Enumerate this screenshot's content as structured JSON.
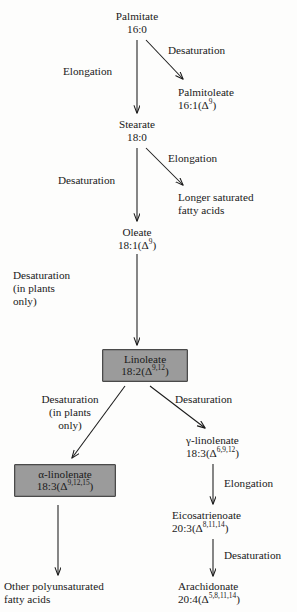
{
  "diagram": {
    "background_color": "#fdfdfc",
    "text_color": "#1a1a1a",
    "highlight_box_fill": "#9b9b9b",
    "highlight_box_border": "#4a4a4a",
    "arrow_color": "#1a1a1a"
  },
  "nodes": {
    "palmitate": {
      "name": "Palmitate",
      "formula": "16:0",
      "formula_html": "16:0",
      "boxed": false
    },
    "palmitoleate": {
      "name": "Palmitoleate",
      "formula": "16:1(Δ9)",
      "formula_html": "16:1(Δ<sup>9</sup>)",
      "boxed": false
    },
    "stearate": {
      "name": "Stearate",
      "formula": "18:0",
      "formula_html": "18:0",
      "boxed": false
    },
    "longer_saturated": {
      "name": "Longer saturated",
      "formula": "fatty acids",
      "formula_html": "fatty acids",
      "boxed": false
    },
    "oleate": {
      "name": "Oleate",
      "formula": "18:1(Δ9)",
      "formula_html": "18:1(Δ<sup>9</sup>)",
      "boxed": false
    },
    "linoleate": {
      "name": "Linoleate",
      "formula": "18:2(Δ9,12)",
      "formula_html": "18:2(Δ<sup>9,12</sup>)",
      "boxed": true
    },
    "alpha_linolenate": {
      "name": "α-linolenate",
      "formula": "18:3(Δ9,12,15)",
      "formula_html": "18:3(Δ<sup>9,12,15</sup>)",
      "boxed": true
    },
    "gamma_linolenate": {
      "name": "γ-linolenate",
      "formula": "18:3(Δ6,9,12)",
      "formula_html": "18:3(Δ<sup>6,9,12</sup>)",
      "boxed": false
    },
    "eicosatrienoate": {
      "name": "Eicosatrienoate",
      "formula": "20:3(Δ8,11,14)",
      "formula_html": "20:3(Δ<sup>8,11,14</sup>)",
      "boxed": false
    },
    "arachidonate": {
      "name": "Arachidonate",
      "formula": "20:4(Δ5,8,11,14)",
      "formula_html": "20:4(Δ<sup>5,8,11,14</sup>)",
      "boxed": false
    },
    "other_pufa": {
      "name": "Other polyunsaturated",
      "formula": "fatty acids",
      "formula_html": "fatty acids",
      "boxed": false
    }
  },
  "edge_labels": {
    "palmitate_desaturation": "Desaturation",
    "palmitate_elongation": "Elongation",
    "stearate_elongation": "Elongation",
    "stearate_desaturation": "Desaturation",
    "oleate_desaturation_l1": "Desaturation",
    "oleate_desaturation_l2": "(in plants",
    "oleate_desaturation_l3": "only)",
    "linoleate_left_l1": "Desaturation",
    "linoleate_left_l2": "(in plants",
    "linoleate_left_l3": "only)",
    "linoleate_right": "Desaturation",
    "gamma_elongation": "Elongation",
    "eicosatrienoate_desaturation": "Desaturation"
  }
}
